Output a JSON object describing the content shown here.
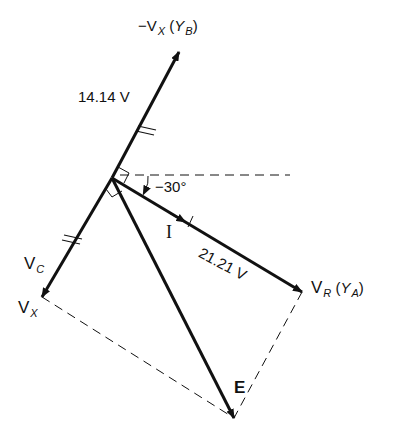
{
  "diagram": {
    "type": "phasor-diagram",
    "labels": {
      "neg_vx": {
        "prefix": "−V",
        "sub": "X",
        "paren_open": " (",
        "paren_var": "Y",
        "paren_sub": "B",
        "paren_close": ")"
      },
      "vc": {
        "main": "V",
        "sub": "C"
      },
      "vx": {
        "main": "V",
        "sub": "X"
      },
      "vr": {
        "main": "V",
        "sub": "R",
        "paren_open": " (",
        "paren_var": "Y",
        "paren_sub": "A",
        "paren_close": ")"
      },
      "current": "I",
      "emf": "E",
      "angle": "−30°",
      "vc_magnitude": "14.14 V",
      "vr_magnitude": "21.21 V"
    },
    "values": {
      "vc_magnitude_v": 14.14,
      "vr_magnitude_v": 21.21,
      "angle_deg": -30
    },
    "colors": {
      "line": "#111111",
      "background": "#ffffff"
    }
  }
}
